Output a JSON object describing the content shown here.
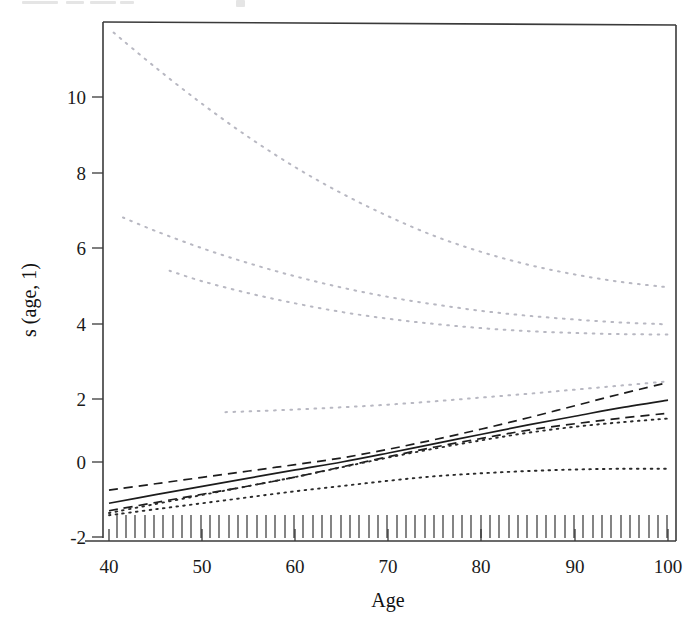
{
  "figure": {
    "name": "smooth-term-plot",
    "background_color": "#ffffff",
    "frame_color": "#3a3a3a"
  },
  "chart_data": {
    "type": "line",
    "title": "",
    "subtitle": "",
    "xlabel": "Age",
    "ylabel": "s (age, 1)",
    "xlim": [
      40,
      100
    ],
    "ylim": [
      -2,
      11.6
    ],
    "xticks": [
      40,
      50,
      60,
      70,
      80,
      90,
      100
    ],
    "xtick_labels": [
      "40",
      "50",
      "60",
      "70",
      "80",
      "90",
      "100"
    ],
    "yticks": [
      -2,
      0,
      2,
      4,
      6,
      8,
      10
    ],
    "ytick_labels": [
      "-2",
      "0",
      "2",
      "4",
      "6",
      "8",
      "10"
    ],
    "grid": false,
    "legend": "none",
    "legend_position": "none",
    "annotations": [],
    "rug_plot": {
      "present": true,
      "axis": "x",
      "description": "dense vertical tick marks along the bottom axis showing observed ages",
      "value_range": [
        40,
        100
      ],
      "approx_count": 62
    },
    "series": [
      {
        "name": "fitted smooth",
        "style": "solid",
        "color": "#1c1c1c",
        "x": [
          40,
          45,
          50,
          55,
          60,
          65,
          70,
          75,
          80,
          85,
          90,
          95,
          100
        ],
        "values": [
          -1.1,
          -0.87,
          -0.65,
          -0.43,
          -0.21,
          0.0,
          0.24,
          0.49,
          0.74,
          0.99,
          1.22,
          1.45,
          1.65
        ]
      },
      {
        "name": "upper confidence band",
        "style": "dashed",
        "color": "#1c1c1c",
        "x": [
          40,
          45,
          50,
          55,
          60,
          65,
          70,
          75,
          80,
          85,
          90,
          95,
          100
        ],
        "values": [
          -0.75,
          -0.58,
          -0.41,
          -0.24,
          -0.07,
          0.11,
          0.34,
          0.6,
          0.88,
          1.18,
          1.5,
          1.82,
          2.12
        ]
      },
      {
        "name": "lower confidence band",
        "style": "dashed",
        "color": "#1c1c1c",
        "x": [
          40,
          45,
          50,
          55,
          60,
          65,
          70,
          75,
          80,
          85,
          90,
          95,
          100
        ],
        "values": [
          -1.3,
          -1.08,
          -0.86,
          -0.64,
          -0.4,
          -0.13,
          0.14,
          0.4,
          0.63,
          0.85,
          1.02,
          1.17,
          1.3
        ]
      },
      {
        "name": "alternative fit A",
        "style": "dotted",
        "color": "#2a2a2a",
        "x": [
          40,
          45,
          50,
          55,
          60,
          65,
          70,
          75,
          80,
          85,
          90,
          95,
          100
        ],
        "values": [
          -1.36,
          -1.12,
          -0.88,
          -0.64,
          -0.4,
          -0.14,
          0.12,
          0.36,
          0.58,
          0.78,
          0.94,
          1.06,
          1.16
        ]
      },
      {
        "name": "alternative fit B",
        "style": "dotted",
        "color": "#2a2a2a",
        "x": [
          40,
          45,
          50,
          55,
          60,
          65,
          70,
          75,
          80,
          85,
          90,
          95,
          100
        ],
        "values": [
          -1.42,
          -1.26,
          -1.1,
          -0.94,
          -0.78,
          -0.64,
          -0.5,
          -0.38,
          -0.3,
          -0.24,
          -0.2,
          -0.18,
          -0.18
        ]
      },
      {
        "name": "upper dispersion curve 1",
        "style": "dotted-faint",
        "color": "#b8b8c2",
        "x": [
          40.5,
          45,
          50,
          55,
          60,
          65,
          70,
          75,
          80,
          85,
          90,
          95,
          100
        ],
        "values": [
          11.45,
          10.52,
          9.55,
          8.66,
          7.86,
          7.16,
          6.55,
          6.02,
          5.6,
          5.26,
          5.0,
          4.8,
          4.66
        ]
      },
      {
        "name": "upper dispersion curve 2",
        "style": "dotted-faint",
        "color": "#b8b8c2",
        "x": [
          41.5,
          45,
          50,
          55,
          60,
          65,
          70,
          75,
          80,
          85,
          90,
          95,
          100
        ],
        "values": [
          6.52,
          6.16,
          5.7,
          5.3,
          4.95,
          4.65,
          4.4,
          4.2,
          4.03,
          3.9,
          3.8,
          3.72,
          3.67
        ]
      },
      {
        "name": "upper dispersion curve 3",
        "style": "dotted-faint",
        "color": "#b8b8c2",
        "x": [
          46.5,
          50,
          55,
          60,
          65,
          70,
          75,
          80,
          85,
          90,
          95,
          100
        ],
        "values": [
          5.1,
          4.82,
          4.5,
          4.23,
          4.0,
          3.82,
          3.68,
          3.57,
          3.49,
          3.44,
          3.41,
          3.4
        ]
      },
      {
        "name": "lower dispersion curve",
        "style": "dotted-faint",
        "color": "#b8b8c2",
        "x": [
          52.5,
          55,
          60,
          65,
          70,
          75,
          80,
          85,
          90,
          95,
          100
        ],
        "values": [
          1.33,
          1.35,
          1.4,
          1.46,
          1.53,
          1.62,
          1.72,
          1.82,
          1.93,
          2.04,
          2.15
        ]
      }
    ]
  }
}
